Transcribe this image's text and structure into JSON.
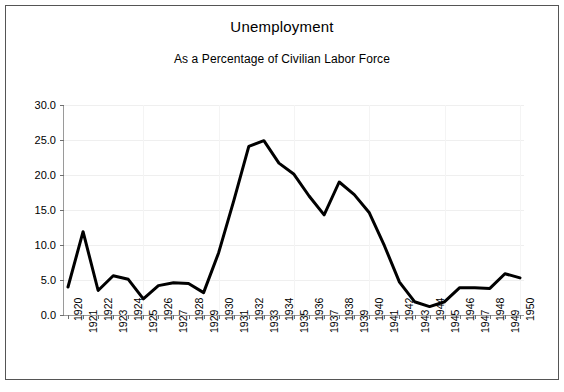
{
  "chart_data": {
    "type": "line",
    "title": "Unemployment",
    "subtitle": "As a Percentage of Civilian Labor Force",
    "xlabel": "",
    "ylabel": "",
    "x": [
      1920,
      1921,
      1922,
      1923,
      1924,
      1925,
      1926,
      1927,
      1928,
      1929,
      1930,
      1931,
      1932,
      1933,
      1934,
      1935,
      1936,
      1937,
      1938,
      1939,
      1940,
      1941,
      1942,
      1943,
      1944,
      1945,
      1946,
      1947,
      1948,
      1949,
      1950
    ],
    "categories": [
      "1920",
      "1921",
      "1922",
      "1923",
      "1924",
      "1925",
      "1926",
      "1927",
      "1928",
      "1929",
      "1930",
      "1931",
      "1932",
      "1933",
      "1934",
      "1935",
      "1936",
      "1937",
      "1938",
      "1939",
      "1940",
      "1941",
      "1942",
      "1943",
      "1944",
      "1945",
      "1946",
      "1947",
      "1948",
      "1949",
      "1950"
    ],
    "values": [
      4.0,
      11.9,
      3.5,
      5.6,
      5.1,
      2.3,
      4.2,
      4.6,
      4.5,
      3.2,
      8.9,
      16.3,
      24.1,
      24.9,
      21.7,
      20.1,
      17.0,
      14.3,
      19.0,
      17.2,
      14.6,
      9.9,
      4.7,
      1.9,
      1.2,
      1.9,
      3.9,
      3.9,
      3.8,
      5.9,
      5.3
    ],
    "series": [
      {
        "name": "Unemployment rate",
        "values": [
          4.0,
          11.9,
          3.5,
          5.6,
          5.1,
          2.3,
          4.2,
          4.6,
          4.5,
          3.2,
          8.9,
          16.3,
          24.1,
          24.9,
          21.7,
          20.1,
          17.0,
          14.3,
          19.0,
          17.2,
          14.6,
          9.9,
          4.7,
          1.9,
          1.2,
          1.9,
          3.9,
          3.9,
          3.8,
          5.9,
          5.3
        ],
        "color": "#000000"
      }
    ],
    "ylim": [
      0.0,
      30.0
    ],
    "yticks": [
      0.0,
      5.0,
      10.0,
      15.0,
      20.0,
      25.0,
      30.0
    ],
    "ytick_labels": [
      "0.0",
      "5.0",
      "10.0",
      "15.0",
      "20.0",
      "25.0",
      "30.0"
    ],
    "grid": true,
    "legend": false,
    "legend_position": "none",
    "line_color": "#000000",
    "line_width": 3,
    "xtick_rotation": -90
  },
  "figure": {
    "background": "#ffffff",
    "border_color": "#555555"
  }
}
